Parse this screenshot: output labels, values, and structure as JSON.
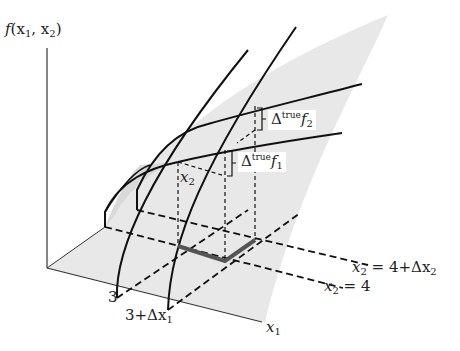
{
  "diagram": {
    "axes": {
      "vertical_label_func": "f",
      "vertical_label_args": "(x",
      "vertical_label_sub1": "1",
      "vertical_label_comma": ", x",
      "vertical_label_sub2": "2",
      "vertical_label_close": ")",
      "x1_label": "x",
      "x1_label_sub": "1"
    },
    "ticks": {
      "x1_tick_a": "3",
      "x1_tick_b_prefix": "3+Δx",
      "x1_tick_b_sub": "1"
    },
    "lines": {
      "x2_eq_4_prefix": "x",
      "x2_eq_4_sub": "2",
      "x2_eq_4_rest": " = 4",
      "x2_eq_4dx_prefix": "x",
      "x2_eq_4dx_sub": "2",
      "x2_eq_4dx_rest": " = 4+Δx",
      "x2_eq_4dx_sub2": "2"
    },
    "annotations": {
      "delta_symbol": "Δ",
      "true_sup": "true",
      "f_symbol": "f",
      "f1_sub": "1",
      "f2_sub": "2",
      "x2_point_label": "x",
      "x2_point_sub": "2"
    },
    "colors": {
      "surface": "#e6e6e6",
      "surface_dark": "#d6d6d6",
      "line": "#1a1a1a",
      "arrow": "#555555"
    }
  }
}
